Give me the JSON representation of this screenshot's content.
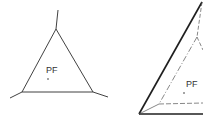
{
  "figures": [
    {
      "id": "left",
      "label": "PF",
      "description": "triangle with extended vertex lines"
    },
    {
      "id": "right",
      "label": "PF",
      "description": "tetrahedral-like triangle with dashed inner triangle"
    }
  ],
  "colors": {
    "line": "#2b2b2b",
    "thin": "#555555",
    "background": "#ffffff"
  }
}
